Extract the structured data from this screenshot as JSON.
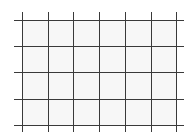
{
  "diagram": {
    "type": "grid",
    "columns": 6,
    "rows": 4,
    "line_color": "#3a3a3a",
    "cell_fill": "#f7f7f7",
    "background": "#ffffff",
    "vertical_lines_x": [
      22,
      48,
      73,
      99,
      125,
      151,
      176
    ],
    "horizontal_lines_y": [
      20,
      46,
      72,
      99,
      125
    ],
    "h_extent": [
      14,
      184
    ],
    "v_extent": [
      12,
      132
    ]
  }
}
